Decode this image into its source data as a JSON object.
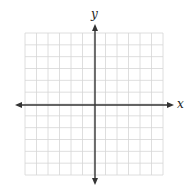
{
  "diagram": {
    "type": "coordinate-plane",
    "x_axis_label": "x",
    "y_axis_label": "y",
    "grid": {
      "columns": 12,
      "rows": 12,
      "left": 25,
      "top": 33,
      "right": 163,
      "bottom": 175,
      "line_color": "#d6d6d6",
      "axis_color": "#333333"
    },
    "origin": {
      "x": 95,
      "y": 105
    },
    "x_axis": {
      "from": 15,
      "to": 174
    },
    "y_axis": {
      "from": 24,
      "to": 185
    }
  }
}
